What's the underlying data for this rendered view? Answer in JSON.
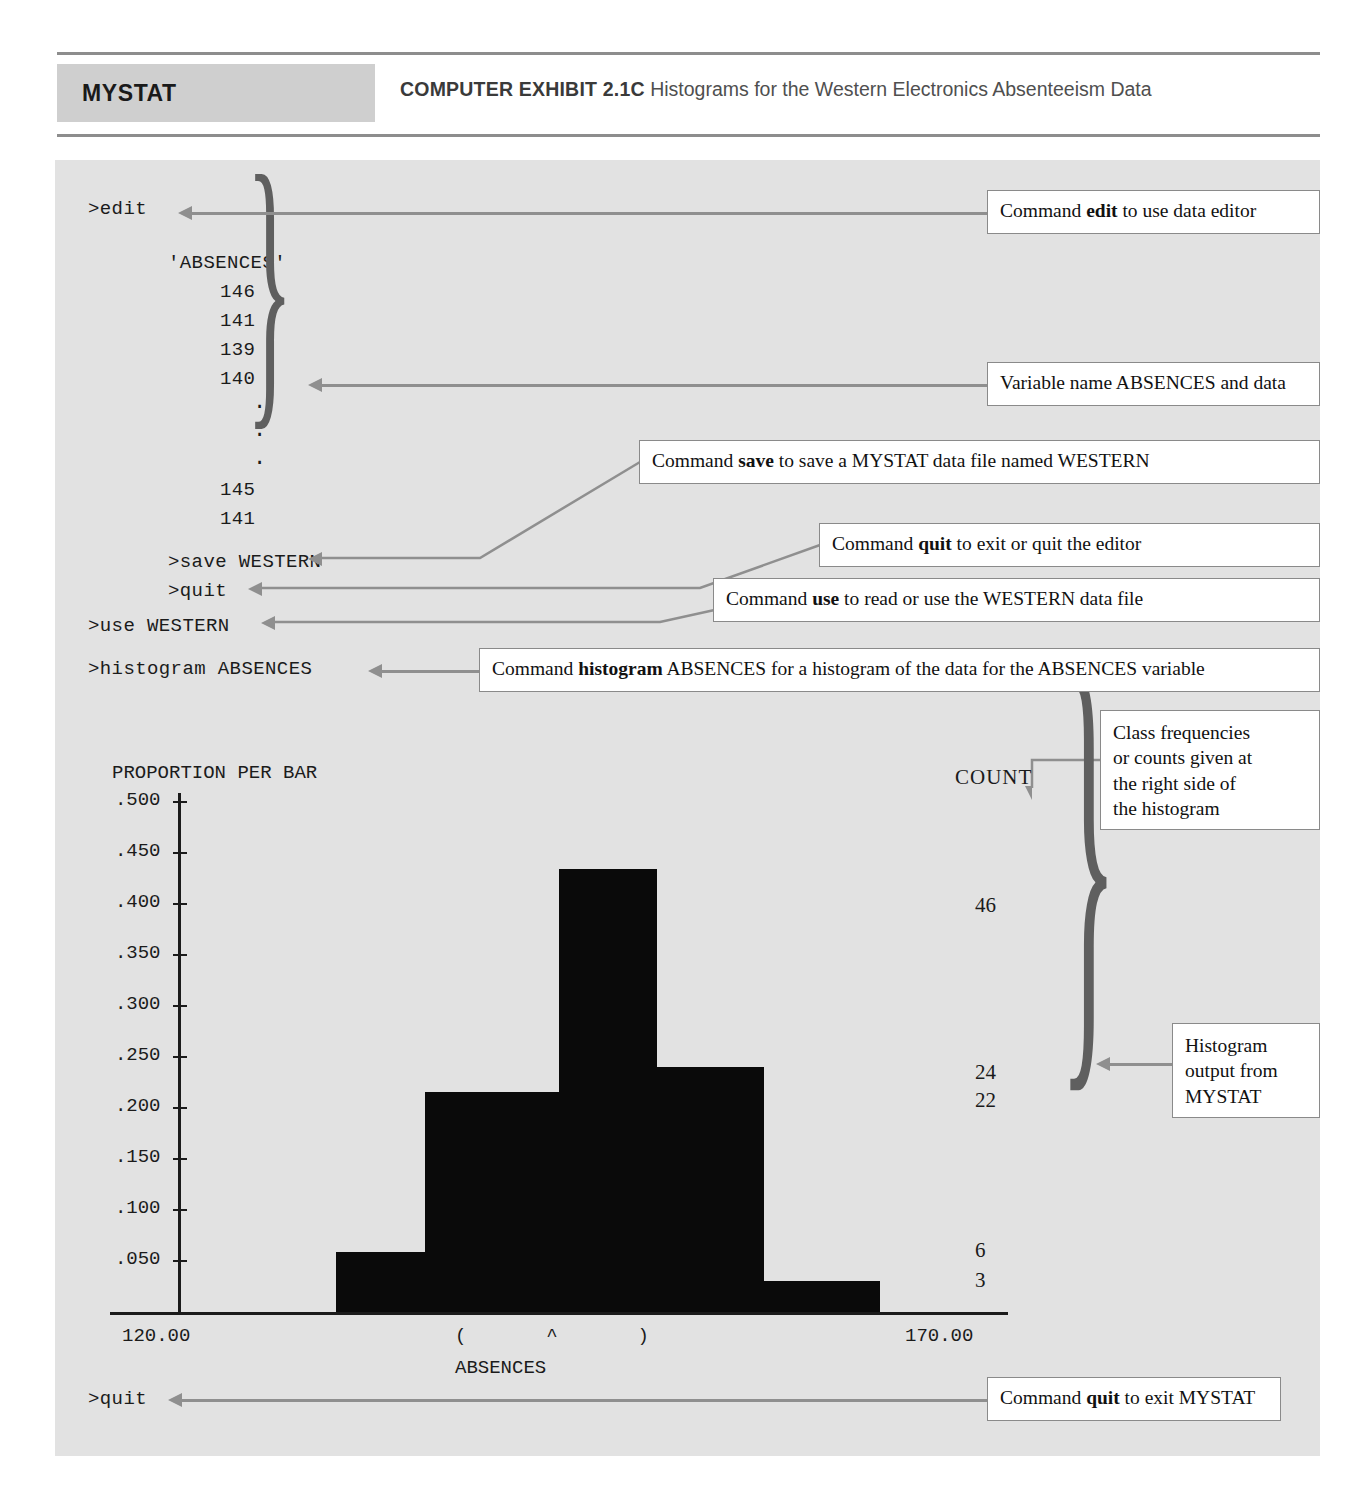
{
  "header": {
    "badge_label": "MYSTAT",
    "exhibit_number": "COMPUTER EXHIBIT 2.1C",
    "exhibit_title": "Histograms for the Western Electronics Absenteeism Data"
  },
  "terminal": {
    "cmd_edit": ">edit",
    "var_name": "'ABSENCES'",
    "data_values": [
      "146",
      "141",
      "139",
      "140"
    ],
    "ellipsis": [
      ".",
      ".",
      "."
    ],
    "data_values_tail": [
      "145",
      "141"
    ],
    "cmd_save": ">save WESTERN",
    "cmd_quit_editor": ">quit",
    "cmd_use": ">use WESTERN",
    "cmd_histogram": ">histogram ABSENCES",
    "cmd_quit_mystat": ">quit"
  },
  "callouts": {
    "edit": {
      "prefix": "Command ",
      "bold": "edit",
      "suffix": " to use data editor"
    },
    "variable": {
      "prefix": "Variable name ABSENCES and data",
      "bold": "",
      "suffix": ""
    },
    "save": {
      "prefix": "Command ",
      "bold": "save",
      "suffix": " to save a MYSTAT data file named WESTERN"
    },
    "quit_editor": {
      "prefix": "Command ",
      "bold": "quit",
      "suffix": " to exit or quit the editor"
    },
    "use": {
      "prefix": "Command ",
      "bold": "use",
      "suffix": " to read or use the WESTERN data file"
    },
    "histogram": {
      "prefix": "Command ",
      "bold": "histogram",
      "suffix": " ABSENCES for a histogram of the data for the ABSENCES variable"
    },
    "class_frequencies": {
      "lines": [
        "Class frequencies",
        "or counts given at",
        "the right side of",
        "the histogram"
      ]
    },
    "histogram_output": {
      "lines": [
        "Histogram",
        "output from",
        "MYSTAT"
      ]
    },
    "quit_mystat": {
      "prefix": "Command ",
      "bold": "quit",
      "suffix": " to exit MYSTAT"
    }
  },
  "chart_data": {
    "type": "bar",
    "title": "",
    "ylabel": "PROPORTION PER BAR",
    "xlabel": "ABSENCES",
    "count_header": "COUNT",
    "ytick_labels": [
      ".500",
      ".450",
      ".400",
      ".350",
      ".300",
      ".250",
      ".200",
      ".150",
      ".100",
      ".050"
    ],
    "ytick_values": [
      0.5,
      0.45,
      0.4,
      0.35,
      0.3,
      0.25,
      0.2,
      0.15,
      0.1,
      0.05
    ],
    "ylim": [
      0,
      0.5
    ],
    "xtick_labels": [
      "120.00",
      "170.00"
    ],
    "xlim": [
      120,
      170
    ],
    "x_range_markers": "(       ^       )",
    "bins": [
      {
        "x_left": 132.5,
        "x_right": 137.5,
        "proportion": 0.059,
        "count": 6
      },
      {
        "x_left": 137.5,
        "x_right": 145.0,
        "proportion": 0.216,
        "count": 22
      },
      {
        "x_left": 145.0,
        "x_right": 150.5,
        "proportion": 0.434,
        "count": 46
      },
      {
        "x_left": 150.5,
        "x_right": 156.5,
        "proportion": 0.24,
        "count": 24
      },
      {
        "x_left": 156.5,
        "x_right": 163.0,
        "proportion": 0.03,
        "count": 3
      }
    ],
    "counts_displayed": [
      "46",
      "24",
      "22",
      "6",
      "3"
    ],
    "grid": false,
    "legend": "none"
  },
  "colors": {
    "panel_bg": "#e2e2e2",
    "badge_bg": "#cfcfcf",
    "bar_fill": "#0a0a0a",
    "connector": "#8f8f8f",
    "rule": "#8d8d8d"
  }
}
